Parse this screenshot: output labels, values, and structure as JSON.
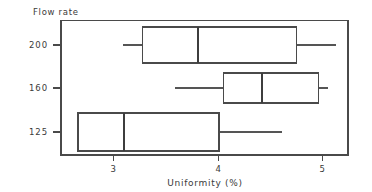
{
  "chart_data": {
    "type": "box",
    "title": "",
    "xlabel": "Uniformity (%)",
    "ylabel": "Flow rate",
    "ylabel_position": "top-left",
    "grid": false,
    "legend": null,
    "xlim": [
      2.52,
      5.27
    ],
    "xticks": [
      3,
      4,
      5
    ],
    "xtick_labels": [
      "3",
      "4",
      "5"
    ],
    "categories": [
      "200",
      "160",
      "125"
    ],
    "category_order": "top-to-bottom",
    "orientation": "horizontal",
    "boxes": [
      {
        "category": "200",
        "whisker_low": 3.09,
        "q1": 3.28,
        "median": 3.81,
        "q3": 4.75,
        "whisker_high": 5.13
      },
      {
        "category": "160",
        "whisker_low": 3.59,
        "q1": 4.05,
        "median": 4.42,
        "q3": 4.96,
        "whisker_high": 5.05
      },
      {
        "category": "125",
        "whisker_low": 2.7,
        "q1": 2.66,
        "median": 3.1,
        "q3": 4.01,
        "whisker_high": 4.61
      }
    ]
  },
  "axes": {
    "y_axis_title": "Flow rate",
    "x_axis_title": "Uniformity (%)",
    "y_tick_labels": [
      "200",
      "160",
      "125"
    ],
    "x_tick_labels": [
      "3",
      "4",
      "5"
    ]
  },
  "colors": {
    "frame": "#4a4a4a",
    "box_stroke": "#4a4a4a",
    "box_fill": "#ffffff",
    "whisker": "#555555",
    "text": "#3a3a3a",
    "background": "#ffffff"
  }
}
